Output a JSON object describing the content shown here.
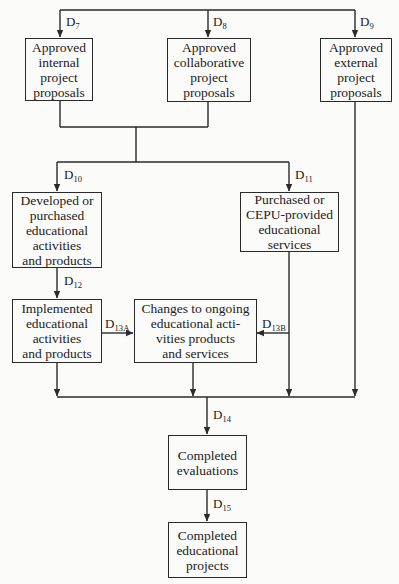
{
  "diagram": {
    "type": "flowchart",
    "nodes": {
      "internal": {
        "label": "Approved\ninternal\nproject\nproposals"
      },
      "collaborative": {
        "label": "Approved\ncollaborative\nproject\nproposals"
      },
      "external": {
        "label": "Approved\nexternal\nproject\nproposals"
      },
      "developed": {
        "label": "Developed or\npurchased\neducational\nactivities\nand products"
      },
      "purchased": {
        "label": "Purchased or\nCEPU-provided\neducational\nservices"
      },
      "implemented": {
        "label": "Implemented\neducational\nactivities\nand products"
      },
      "changes": {
        "label": "Changes to ongoing\neducational acti-\nvities products\nand services"
      },
      "evaluations": {
        "label": "Completed\nevaluations"
      },
      "projects": {
        "label": "Completed\neducational\nprojects"
      }
    },
    "decisions": {
      "d7": {
        "letter": "D",
        "sub": "7"
      },
      "d8": {
        "letter": "D",
        "sub": "8"
      },
      "d9": {
        "letter": "D",
        "sub": "9"
      },
      "d10": {
        "letter": "D",
        "sub": "10"
      },
      "d11": {
        "letter": "D",
        "sub": "11"
      },
      "d12": {
        "letter": "D",
        "sub": "12"
      },
      "d13a": {
        "letter": "D",
        "sub": "13A"
      },
      "d13b": {
        "letter": "D",
        "sub": "13B"
      },
      "d14": {
        "letter": "D",
        "sub": "14"
      },
      "d15": {
        "letter": "D",
        "sub": "15"
      }
    },
    "edges": [
      {
        "from": "top",
        "to": "internal",
        "label": "D7"
      },
      {
        "from": "top",
        "to": "collaborative",
        "label": "D8"
      },
      {
        "from": "top",
        "to": "external",
        "label": "D9"
      },
      {
        "from": "internal+collaborative",
        "to": "developed",
        "label": "D10"
      },
      {
        "from": "internal+collaborative",
        "to": "purchased",
        "label": "D11"
      },
      {
        "from": "developed",
        "to": "implemented",
        "label": "D12"
      },
      {
        "from": "implemented",
        "to": "changes",
        "label": "D13A"
      },
      {
        "from": "purchased",
        "to": "changes",
        "label": "D13B"
      },
      {
        "from": "implemented+changes+purchased+external",
        "to": "evaluations",
        "label": "D14"
      },
      {
        "from": "evaluations",
        "to": "projects",
        "label": "D15"
      }
    ],
    "colors": {
      "line": "#2a2a2a",
      "background": "#fbfbf9",
      "text": "#222222"
    }
  }
}
